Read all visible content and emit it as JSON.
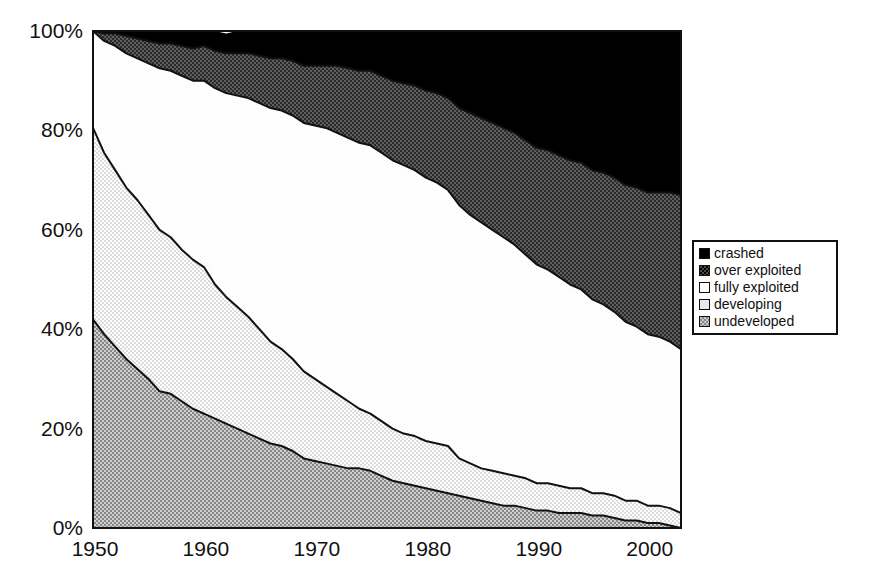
{
  "chart_data": {
    "type": "area",
    "title": "",
    "subtitle": "",
    "xlabel": "",
    "ylabel": "",
    "stacked": true,
    "normalized_percent": true,
    "grid": false,
    "legend_position": "right",
    "xlim": [
      1950,
      2003
    ],
    "ylim": [
      0,
      100
    ],
    "x_tick_labels": [
      "1950",
      "1960",
      "1970",
      "1980",
      "1990",
      "2000"
    ],
    "x_ticks": [
      1950,
      1960,
      1970,
      1980,
      1990,
      2000
    ],
    "y_tick_labels": [
      "0%",
      "20%",
      "40%",
      "60%",
      "80%",
      "100%"
    ],
    "y_ticks": [
      0,
      20,
      40,
      60,
      80,
      100
    ],
    "x": [
      1950,
      1951,
      1952,
      1953,
      1954,
      1955,
      1956,
      1957,
      1958,
      1959,
      1960,
      1961,
      1962,
      1963,
      1964,
      1965,
      1966,
      1967,
      1968,
      1969,
      1970,
      1971,
      1972,
      1973,
      1974,
      1975,
      1976,
      1977,
      1978,
      1979,
      1980,
      1981,
      1982,
      1983,
      1984,
      1985,
      1986,
      1987,
      1988,
      1989,
      1990,
      1991,
      1992,
      1993,
      1994,
      1995,
      1996,
      1997,
      1998,
      1999,
      2000,
      2001,
      2002,
      2003
    ],
    "series": [
      {
        "name": "undeveloped",
        "color": "#a8a8a8",
        "pattern": "dither-50",
        "values": [
          42,
          39,
          36.5,
          34,
          32,
          30,
          27.5,
          27,
          25.5,
          24,
          23,
          22,
          21,
          20,
          19,
          18,
          17,
          16.5,
          15.5,
          14,
          13.5,
          13,
          12.5,
          12,
          12,
          11.5,
          10.5,
          9.5,
          9,
          8.5,
          8,
          7.5,
          7,
          6.5,
          6,
          5.5,
          5,
          4.5,
          4.5,
          4,
          3.5,
          3.5,
          3,
          3,
          3,
          2.5,
          2.5,
          2,
          1.5,
          1.5,
          1,
          1,
          0.5,
          0
        ]
      },
      {
        "name": "developing",
        "color": "#e9e9e9",
        "pattern": "dither-light",
        "values": [
          38.5,
          36.5,
          35.5,
          34.5,
          34,
          33,
          32.5,
          31.5,
          30.5,
          30,
          29.5,
          27,
          25.5,
          24.5,
          23.5,
          22,
          20.5,
          19.5,
          18.5,
          17.5,
          16.5,
          15.5,
          14.5,
          13.5,
          12,
          11.5,
          11,
          10.5,
          10,
          10,
          9.5,
          9.5,
          9.5,
          7.5,
          7,
          6.5,
          6.5,
          6.5,
          6,
          6,
          5.5,
          5.5,
          5.5,
          5,
          5,
          4.5,
          4.5,
          4.5,
          4,
          4,
          3.5,
          3.5,
          3.5,
          3
        ]
      },
      {
        "name": "fully exploited",
        "color": "#ffffff",
        "pattern": "solid",
        "values": [
          19.5,
          22.5,
          25,
          27,
          28.5,
          30.5,
          32.5,
          33.5,
          35,
          36,
          37.5,
          39.5,
          41,
          42.5,
          44,
          45.5,
          47,
          48,
          49,
          50,
          51,
          52,
          52.5,
          53,
          53.5,
          54,
          54,
          54,
          54,
          53.5,
          53,
          52.5,
          51.5,
          51,
          50,
          49.5,
          48.5,
          47.5,
          46.5,
          45,
          44,
          43,
          42,
          41,
          40,
          39,
          38,
          37,
          36,
          35,
          34.5,
          34,
          33.5,
          33
        ]
      },
      {
        "name": "over exploited",
        "color": "#4a4a4a",
        "pattern": "dither-dark",
        "values": [
          0,
          1.5,
          2.5,
          3.5,
          4,
          4.5,
          5,
          5.5,
          6,
          6.5,
          7,
          7.5,
          8,
          8.5,
          9,
          9.5,
          10,
          10.5,
          11,
          11.5,
          12,
          12.5,
          13.5,
          14,
          14.5,
          15,
          15.5,
          16,
          16.5,
          17,
          17.5,
          18,
          18.5,
          19.5,
          20.5,
          21,
          21.5,
          22,
          22.5,
          23,
          23.5,
          24,
          24.5,
          25,
          25.5,
          26,
          26.5,
          27,
          27.5,
          28,
          28.5,
          29,
          30,
          31
        ]
      },
      {
        "name": "crashed",
        "color": "#000000",
        "pattern": "solid",
        "values": [
          0,
          0.5,
          0.5,
          1,
          1.5,
          2,
          2.5,
          2.5,
          3,
          3.5,
          3.5,
          4,
          4,
          4.5,
          4.5,
          5,
          5.5,
          5.5,
          6,
          7,
          7.5,
          7,
          7,
          7.5,
          8,
          8,
          9,
          10,
          10.5,
          11,
          12,
          12.5,
          13.5,
          15.5,
          16.5,
          17.5,
          18.5,
          19.5,
          20.5,
          22,
          23.5,
          24,
          25,
          26,
          26.5,
          28,
          28.5,
          29.5,
          31,
          31.5,
          32.5,
          32.5,
          32.5,
          33
        ]
      }
    ]
  },
  "legend": {
    "items": [
      {
        "label": "crashed",
        "swatch_class": "sw-crashed",
        "swatch_name": "legend-swatch-crashed"
      },
      {
        "label": "over exploited",
        "swatch_class": "sw-over",
        "swatch_name": "legend-swatch-over-exploited"
      },
      {
        "label": "fully exploited",
        "swatch_class": "sw-fully",
        "swatch_name": "legend-swatch-fully-exploited"
      },
      {
        "label": "developing",
        "swatch_class": "sw-developing",
        "swatch_name": "legend-swatch-developing"
      },
      {
        "label": "undeveloped",
        "swatch_class": "sw-undeveloped",
        "swatch_name": "legend-swatch-undeveloped"
      }
    ]
  }
}
